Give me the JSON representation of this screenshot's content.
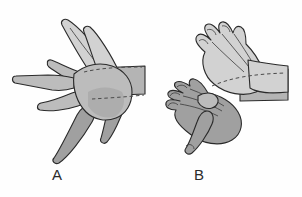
{
  "figure": {
    "kind": "anatomical-line-illustration",
    "background_color": "#fefefe",
    "panels": [
      {
        "id": "A",
        "label": "A",
        "label_x": 52,
        "label_y": 167,
        "description": "Hand with fingers spread apart (abduction), palmar view with forearm entering from the right",
        "finger_position": "abducted"
      },
      {
        "id": "B",
        "label": "B",
        "label_x": 194,
        "label_y": 167,
        "description": "Hand with fingers held together (adduction), two overlapping hands with forearm entering from the right",
        "finger_position": "adducted"
      }
    ],
    "colors": {
      "outline": "#2a2a2a",
      "hand_light_fill": "#cfcfcf",
      "hand_mid_fill": "#b6b6b6",
      "hand_dark_fill": "#9a9a9a",
      "forearm_fill": "#b0b0b0",
      "dashed_wrist_line": "#4a4a4a",
      "label_text": "#2b2b2b",
      "background": "#fefefe"
    }
  }
}
